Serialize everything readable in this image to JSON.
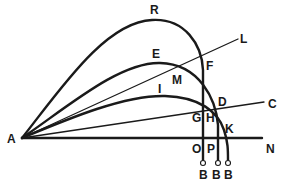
{
  "diagram": {
    "title": "",
    "colors": {
      "ink": "#1a1a1a",
      "background": "#ffffff"
    },
    "labels": {
      "A": "A",
      "R": "R",
      "L": "L",
      "E": "E",
      "M": "M",
      "F": "F",
      "I": "I",
      "D": "D",
      "C": "C",
      "G": "G",
      "H": "H",
      "K": "K",
      "O": "O",
      "P": "P",
      "N": "N",
      "B1": "B",
      "B2": "B",
      "B3": "B"
    },
    "lines": [
      {
        "id": "AN",
        "from": "A",
        "to": "N",
        "kind": "horizontal"
      },
      {
        "id": "AL",
        "from": "A",
        "to": "L",
        "kind": "inclined"
      },
      {
        "id": "AC",
        "from": "A",
        "to": "C",
        "kind": "inclined"
      }
    ],
    "curves": [
      {
        "id": "curve-R",
        "apex_label": "R",
        "passes": [
          "F",
          "G",
          "O"
        ],
        "ends": "B"
      },
      {
        "id": "curve-E",
        "apex_label": "E",
        "passes": [
          "M",
          "D",
          "H",
          "P"
        ],
        "ends": "B"
      },
      {
        "id": "curve-I",
        "apex_label": "I",
        "passes": [
          "K"
        ],
        "ends": "B"
      }
    ]
  }
}
